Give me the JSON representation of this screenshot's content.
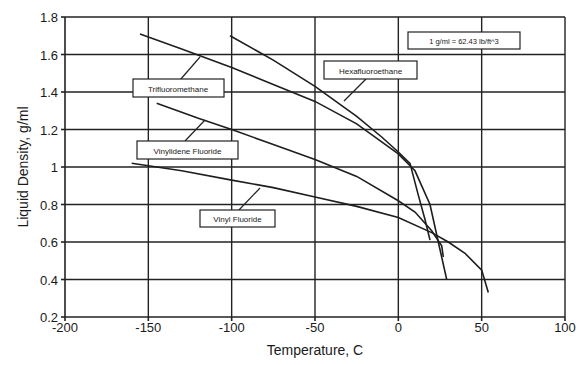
{
  "chart_data": {
    "type": "line",
    "title": "",
    "xlabel": "Temperature, C",
    "ylabel": "Liquid Density, g/ml",
    "xlim": [
      -200,
      100
    ],
    "ylim": [
      0.2,
      1.8
    ],
    "x_ticks": [
      -200,
      -150,
      -100,
      -50,
      0,
      50,
      100
    ],
    "y_ticks": [
      0.2,
      0.4,
      0.6,
      0.8,
      1,
      1.2,
      1.4,
      1.6,
      1.8
    ],
    "x_tick_labels": [
      "-200",
      "-150",
      "-100",
      "-50",
      "0",
      "50",
      "100"
    ],
    "y_tick_labels": [
      "0.2",
      "0.4",
      "0.6",
      "0.8",
      "1",
      "1.2",
      "1.4",
      "1.6",
      "1.8"
    ],
    "grid": true,
    "legend_position": "inline callout labels",
    "annotations": [
      {
        "text": "1 g/ml = 62.43 lb/ft^3",
        "position": "top-right"
      }
    ],
    "series": [
      {
        "name": "Trifluoromethane",
        "x": [
          -155,
          -130,
          -100,
          -75,
          -50,
          -25,
          0,
          10,
          19,
          24,
          29
        ],
        "y": [
          1.71,
          1.63,
          1.53,
          1.44,
          1.35,
          1.23,
          1.07,
          0.98,
          0.8,
          0.6,
          0.4
        ]
      },
      {
        "name": "Hexafluoroethane",
        "x": [
          -101,
          -75,
          -50,
          -25,
          -10,
          0,
          7,
          12,
          16,
          19
        ],
        "y": [
          1.7,
          1.57,
          1.43,
          1.27,
          1.16,
          1.08,
          1.02,
          0.85,
          0.72,
          0.61
        ]
      },
      {
        "name": "Vinylidene Fluoride",
        "x": [
          -145,
          -120,
          -100,
          -75,
          -50,
          -25,
          0,
          10,
          20,
          26,
          27
        ],
        "y": [
          1.34,
          1.26,
          1.2,
          1.12,
          1.04,
          0.95,
          0.82,
          0.76,
          0.66,
          0.58,
          0.52
        ]
      },
      {
        "name": "Vinyl Fluoride",
        "x": [
          -160,
          -130,
          -100,
          -75,
          -50,
          -25,
          0,
          20,
          30,
          40,
          50,
          54
        ],
        "y": [
          1.02,
          0.98,
          0.93,
          0.89,
          0.84,
          0.79,
          0.73,
          0.65,
          0.6,
          0.54,
          0.45,
          0.33
        ]
      }
    ]
  },
  "labels": {
    "xlabel": "Temperature, C",
    "ylabel": "Liquid Density, g/ml",
    "conversion_note": "1 g/ml = 62.43 lb/ft^3",
    "trifluoromethane": "Trifluoromethane",
    "hexafluoroethane": "Hexafluoroethane",
    "vinylidene_fluoride": "Vinylidene Fluoride",
    "vinyl_fluoride": "Vinyl Fluoride"
  }
}
